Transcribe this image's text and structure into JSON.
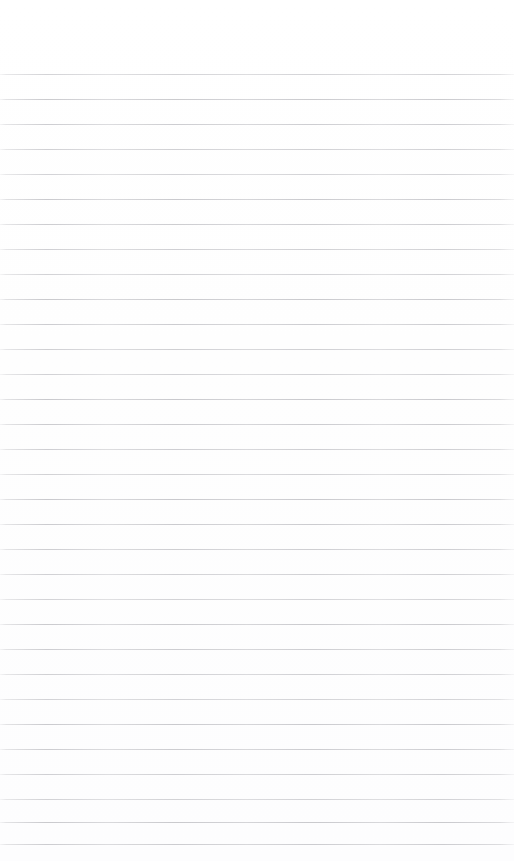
{
  "document": {
    "kind": "lined-paper",
    "title": "",
    "body_text": "",
    "page_width": 514,
    "page_height": 861,
    "background_color": "#ffffff"
  },
  "ruling": {
    "line_color": "#c9c9cd",
    "line_thickness_px": 1,
    "line_spacing_px": 25,
    "first_line_y_px": 74,
    "last_line_y_px": 844,
    "line_count": 32,
    "left_inset_px": 0,
    "right_inset_px": 0,
    "has_margin_rule": false,
    "has_page_border": false,
    "line_y_positions": [
      74,
      99,
      124,
      149,
      174,
      199,
      224,
      249,
      274,
      299,
      324,
      349,
      374,
      399,
      424,
      449,
      474,
      499,
      524,
      549,
      574,
      599,
      624,
      649,
      674,
      699,
      724,
      749,
      774,
      799,
      822,
      844
    ]
  },
  "content": {
    "lines": [
      "",
      "",
      "",
      "",
      "",
      "",
      "",
      "",
      "",
      "",
      "",
      "",
      "",
      "",
      "",
      "",
      "",
      "",
      "",
      "",
      "",
      "",
      "",
      "",
      "",
      "",
      "",
      "",
      "",
      "",
      "",
      ""
    ]
  }
}
